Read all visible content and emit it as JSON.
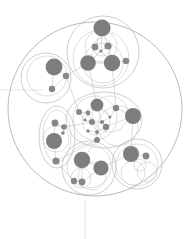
{
  "canvas": {
    "width": 191,
    "height": 239,
    "background": "#ffffff"
  },
  "style": {
    "node_fill": "#878787",
    "node_fill_dark": "#7d7d7d",
    "hull_stroke": "#b9b9b9",
    "hull_stroke_faint": "#cfcfcf",
    "edge_stroke": "#c2c2c2",
    "axis_stroke": "#dcdcdc",
    "outer_stroke": "#a8a8a8",
    "ghost_stroke": "#dedede"
  },
  "chart_data": {
    "type": "scatter",
    "title": "",
    "subtitle": "",
    "xlabel": "",
    "ylabel": "",
    "legend": [],
    "annotations": [],
    "grid": false,
    "xlim": [
      0,
      191
    ],
    "ylim": [
      0,
      239
    ],
    "outer_boundary": {
      "cx": 95,
      "cy": 109,
      "r": 87
    },
    "axes": [
      {
        "name": "horizontal-axis",
        "x1": 0,
        "y1": 90,
        "x2": 42,
        "y2": 90
      },
      {
        "name": "vertical-axis",
        "x1": 85,
        "y1": 200,
        "x2": 85,
        "y2": 239
      }
    ],
    "clusters": [
      {
        "id": "cluster-top",
        "label": "Top cluster",
        "hulls": [
          {
            "shape": "circle",
            "cx": 103,
            "cy": 52,
            "r": 36
          },
          {
            "shape": "circle",
            "cx": 101,
            "cy": 58,
            "r": 28
          },
          {
            "shape": "circle",
            "cx": 101,
            "cy": 46,
            "r": 16
          },
          {
            "shape": "circle",
            "cx": 103,
            "cy": 63,
            "r": 20
          },
          {
            "shape": "circle",
            "cx": 102,
            "cy": 47,
            "r": 9
          }
        ],
        "nodes": [
          {
            "id": "t1",
            "cx": 102,
            "cy": 28,
            "r": 8.5
          },
          {
            "id": "t2",
            "cx": 95,
            "cy": 47,
            "r": 3.4
          },
          {
            "id": "t3",
            "cx": 108,
            "cy": 46,
            "r": 3.6
          },
          {
            "id": "t4",
            "cx": 101,
            "cy": 51,
            "r": 1.6
          },
          {
            "id": "t5",
            "cx": 88,
            "cy": 63,
            "r": 7.8
          },
          {
            "id": "t6",
            "cx": 112,
            "cy": 63,
            "r": 8.2
          },
          {
            "id": "t7",
            "cx": 126,
            "cy": 61,
            "r": 3.2
          }
        ],
        "edges": [
          [
            "t1",
            "t2"
          ],
          [
            "t1",
            "t3"
          ],
          [
            "t2",
            "t4"
          ],
          [
            "t3",
            "t4"
          ],
          [
            "t2",
            "t5"
          ],
          [
            "t3",
            "t6"
          ],
          [
            "t4",
            "t5"
          ],
          [
            "t4",
            "t6"
          ],
          [
            "t5",
            "t6"
          ],
          [
            "t6",
            "t7"
          ],
          [
            "t5",
            "t4"
          ],
          [
            "t1",
            "t4"
          ]
        ]
      },
      {
        "id": "cluster-left",
        "label": "Left cluster",
        "hulls": [
          {
            "shape": "circle",
            "cx": 46,
            "cy": 78,
            "r": 25
          },
          {
            "shape": "circle",
            "cx": 47,
            "cy": 76,
            "r": 20
          }
        ],
        "nodes": [
          {
            "id": "l1",
            "cx": 54,
            "cy": 67,
            "r": 8.4
          },
          {
            "id": "l2",
            "cx": 66,
            "cy": 76,
            "r": 3.2
          },
          {
            "id": "l3",
            "cx": 52,
            "cy": 89,
            "r": 3.2
          }
        ],
        "edges": [
          [
            "l1",
            "l2"
          ],
          [
            "l1",
            "l3"
          ],
          [
            "l2",
            "l3"
          ]
        ]
      },
      {
        "id": "cluster-center",
        "label": "Center cluster",
        "hulls": [
          {
            "shape": "ellipse",
            "cx": 104,
            "cy": 120,
            "rx": 38,
            "ry": 28
          },
          {
            "shape": "circle",
            "cx": 95,
            "cy": 118,
            "r": 22
          },
          {
            "shape": "circle",
            "cx": 110,
            "cy": 114,
            "r": 18
          },
          {
            "shape": "circle",
            "cx": 96,
            "cy": 121,
            "r": 14
          },
          {
            "shape": "circle",
            "cx": 118,
            "cy": 126,
            "r": 20
          }
        ],
        "nodes": [
          {
            "id": "c1",
            "cx": 97,
            "cy": 105,
            "r": 6.4
          },
          {
            "id": "c2",
            "cx": 79,
            "cy": 112,
            "r": 3.0
          },
          {
            "id": "c3",
            "cx": 88,
            "cy": 113,
            "r": 2.4
          },
          {
            "id": "c4",
            "cx": 116,
            "cy": 108,
            "r": 3.2
          },
          {
            "id": "c5",
            "cx": 133,
            "cy": 116,
            "r": 8.0
          },
          {
            "id": "c6",
            "cx": 92,
            "cy": 122,
            "r": 3.0
          },
          {
            "id": "c7",
            "cx": 102,
            "cy": 122,
            "r": 2.1
          },
          {
            "id": "c8",
            "cx": 106,
            "cy": 127,
            "r": 3.2
          },
          {
            "id": "c9",
            "cx": 97,
            "cy": 132,
            "r": 1.9
          },
          {
            "id": "c10",
            "cx": 88,
            "cy": 131,
            "r": 1.7
          },
          {
            "id": "c11",
            "cx": 97,
            "cy": 140,
            "r": 3.0
          },
          {
            "id": "c12",
            "cx": 85,
            "cy": 120,
            "r": 1.6
          },
          {
            "id": "c13",
            "cx": 110,
            "cy": 117,
            "r": 1.5
          }
        ],
        "edges": [
          [
            "c1",
            "c3"
          ],
          [
            "c2",
            "c3"
          ],
          [
            "c3",
            "c6"
          ],
          [
            "c1",
            "c13"
          ],
          [
            "c13",
            "c4"
          ],
          [
            "c4",
            "c5"
          ],
          [
            "c1",
            "c7"
          ],
          [
            "c7",
            "c8"
          ],
          [
            "c6",
            "c9"
          ],
          [
            "c9",
            "c11"
          ],
          [
            "c10",
            "c9"
          ],
          [
            "c6",
            "c12"
          ],
          [
            "c12",
            "c2"
          ],
          [
            "c8",
            "c5"
          ],
          [
            "c7",
            "c6"
          ],
          [
            "c8",
            "c9"
          ],
          [
            "c13",
            "c7"
          ],
          [
            "c3",
            "c12"
          ]
        ]
      },
      {
        "id": "cluster-lower-left",
        "label": "Lower-left cluster",
        "hulls": [
          {
            "shape": "ellipse",
            "cx": 57,
            "cy": 137,
            "rx": 18,
            "ry": 31
          },
          {
            "shape": "ellipse",
            "cx": 57,
            "cy": 136,
            "rx": 14,
            "ry": 26
          },
          {
            "shape": "circle",
            "cx": 56,
            "cy": 139,
            "r": 13
          }
        ],
        "nodes": [
          {
            "id": "b1",
            "cx": 55,
            "cy": 123,
            "r": 3.4
          },
          {
            "id": "b2",
            "cx": 64,
            "cy": 127,
            "r": 2.8
          },
          {
            "id": "b3",
            "cx": 63,
            "cy": 133,
            "r": 1.8
          },
          {
            "id": "b4",
            "cx": 54,
            "cy": 141,
            "r": 8.0
          },
          {
            "id": "b5",
            "cx": 56,
            "cy": 161,
            "r": 3.6
          }
        ],
        "edges": [
          [
            "b1",
            "b4"
          ],
          [
            "b2",
            "b3"
          ],
          [
            "b3",
            "b4"
          ],
          [
            "b4",
            "b5"
          ],
          [
            "b1",
            "b2"
          ]
        ]
      },
      {
        "id": "cluster-bottom-center",
        "label": "Bottom-center cluster",
        "hulls": [
          {
            "shape": "circle",
            "cx": 89,
            "cy": 168,
            "r": 27
          },
          {
            "shape": "circle",
            "cx": 89,
            "cy": 166,
            "r": 22
          },
          {
            "shape": "circle",
            "cx": 92,
            "cy": 176,
            "r": 14
          },
          {
            "shape": "circle",
            "cx": 81,
            "cy": 178,
            "r": 10
          }
        ],
        "nodes": [
          {
            "id": "n1",
            "cx": 82,
            "cy": 160,
            "r": 8.2
          },
          {
            "id": "n2",
            "cx": 101,
            "cy": 168,
            "r": 7.6
          },
          {
            "id": "n3",
            "cx": 74,
            "cy": 181,
            "r": 3.2
          },
          {
            "id": "n4",
            "cx": 82,
            "cy": 182,
            "r": 3.4
          }
        ],
        "edges": [
          [
            "n1",
            "n2"
          ],
          [
            "n1",
            "n4"
          ],
          [
            "n3",
            "n4"
          ],
          [
            "n2",
            "n4"
          ]
        ]
      },
      {
        "id": "cluster-bottom-right",
        "label": "Bottom-right cluster",
        "hulls": [
          {
            "shape": "circle",
            "cx": 137,
            "cy": 164,
            "r": 25
          },
          {
            "shape": "circle",
            "cx": 137,
            "cy": 165,
            "r": 21
          },
          {
            "shape": "circle",
            "cx": 133,
            "cy": 173,
            "r": 12
          },
          {
            "shape": "circle",
            "cx": 147,
            "cy": 172,
            "r": 10
          },
          {
            "shape": "circle",
            "cx": 140,
            "cy": 165,
            "r": 6
          }
        ],
        "nodes": [
          {
            "id": "r1",
            "cx": 131,
            "cy": 154,
            "r": 8.0
          },
          {
            "id": "r2",
            "cx": 146,
            "cy": 156,
            "r": 3.4
          }
        ],
        "edges": [
          [
            "r1",
            "r2"
          ]
        ]
      }
    ],
    "inter_cluster_edges": [
      [
        "t5",
        "c1"
      ],
      [
        "t6",
        "c4"
      ],
      [
        "l2",
        "c2"
      ],
      [
        "c11",
        "n1"
      ],
      [
        "c5",
        "r1"
      ],
      [
        "c6",
        "b2"
      ],
      [
        "n2",
        "r1"
      ],
      [
        "b5",
        "n3"
      ],
      [
        "t5",
        "l2"
      ],
      [
        "c11",
        "b5"
      ]
    ]
  }
}
